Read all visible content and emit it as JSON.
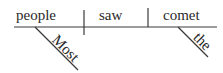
{
  "diagram": {
    "type": "reed-kellogg-sentence-diagram",
    "sentence": "Most people saw the comet",
    "subject": "people",
    "verb": "saw",
    "object": "comet",
    "modifiers": {
      "subject": "Most",
      "object": "the"
    },
    "colors": {
      "line": "#3a3a3a",
      "text": "#2a2a2a",
      "background": "#ffffff"
    }
  }
}
